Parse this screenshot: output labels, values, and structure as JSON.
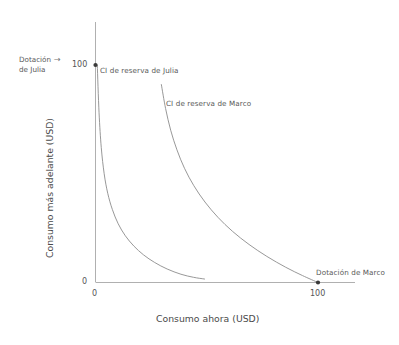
{
  "chart_data": {
    "type": "line",
    "title": "",
    "xlabel": "Consumo ahora (USD)",
    "ylabel": "Consumo más adelante (USD)",
    "xlim": [
      0,
      118
    ],
    "ylim": [
      0,
      123
    ],
    "xticks": [
      "0",
      "100"
    ],
    "xtick_values": [
      0,
      100
    ],
    "yticks": [
      "0",
      "100"
    ],
    "ytick_values": [
      0,
      100
    ],
    "grid": false,
    "legend": "none",
    "series": [
      {
        "name": "CI de reserva de Julia",
        "label": "CI de reserva de Julia",
        "points": [
          [
            0.8,
            100
          ],
          [
            1.6,
            78
          ],
          [
            2.6,
            62
          ],
          [
            3.9,
            50
          ],
          [
            5.5,
            41
          ],
          [
            7.6,
            33.5
          ],
          [
            10.2,
            27
          ],
          [
            13.4,
            21.5
          ],
          [
            17.2,
            16.8
          ],
          [
            21.6,
            12.7
          ],
          [
            26.6,
            9.2
          ],
          [
            32.2,
            6.2
          ],
          [
            38.4,
            3.8
          ],
          [
            44.0,
            2.4
          ],
          [
            49.0,
            1.6
          ]
        ]
      },
      {
        "name": "CI de reserva de Marco",
        "label": "CI de reserva de Marco",
        "points": [
          [
            29.6,
            91
          ],
          [
            31.5,
            80
          ],
          [
            33.8,
            70
          ],
          [
            36.6,
            61
          ],
          [
            40.0,
            52.5
          ],
          [
            44.2,
            44.5
          ],
          [
            49.2,
            37
          ],
          [
            55.0,
            30
          ],
          [
            61.6,
            23.5
          ],
          [
            69.0,
            17.5
          ],
          [
            77.0,
            12
          ],
          [
            85.5,
            7
          ],
          [
            93.0,
            3.2
          ],
          [
            100,
            0
          ]
        ]
      }
    ],
    "annotations": [
      {
        "name": "dotacion-julia",
        "text_lines": [
          "Dotación",
          "de Julia"
        ],
        "arrow": "→",
        "points_to": [
          0,
          100
        ],
        "marker": true
      },
      {
        "name": "dotacion-marco",
        "text_lines": [
          "Dotación de Marco"
        ],
        "points_to": [
          100,
          0
        ],
        "marker": true
      },
      {
        "name": "ci-julia-label",
        "text_lines": [
          "CI de reserva de Julia"
        ]
      },
      {
        "name": "ci-marco-label",
        "text_lines": [
          "CI de reserva de Marco"
        ]
      }
    ],
    "colors": {
      "curve": "#8c8c8c",
      "axis": "#b0b0b0",
      "marker": "#3a3a3a",
      "text": "#595959",
      "background": "#ffffff"
    }
  },
  "labels": {
    "x_axis_title": "Consumo ahora (USD)",
    "y_axis_title": "Consumo más adelante (USD)",
    "x_tick_0": "0",
    "x_tick_100": "100",
    "y_tick_0": "0",
    "y_tick_100": "100",
    "dotacion_julia_line1": "Dotación",
    "dotacion_julia_line2": "de Julia",
    "dotacion_julia_arrow": "→",
    "dotacion_marco": "Dotación de Marco",
    "ci_julia": "CI de reserva de Julia",
    "ci_marco": "CI de reserva de Marco"
  }
}
